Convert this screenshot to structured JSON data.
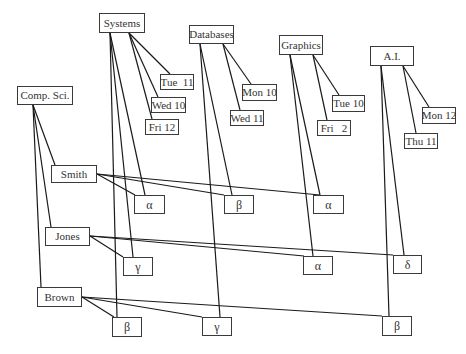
{
  "diagram": {
    "width": 466,
    "height": 354,
    "colors": {
      "line": "#1a1a1a",
      "box_border": "#3a3a3a",
      "text": "#333333",
      "background": "#ffffff"
    },
    "nodes": [
      {
        "id": "systems",
        "label": "Systems",
        "kind": "course",
        "x": 99,
        "y": 13,
        "w": 46,
        "h": 20
      },
      {
        "id": "databases",
        "label": "Databases",
        "kind": "course",
        "x": 189,
        "y": 25,
        "w": 45,
        "h": 19
      },
      {
        "id": "graphics",
        "label": "Graphics",
        "kind": "course",
        "x": 279,
        "y": 35,
        "w": 44,
        "h": 20
      },
      {
        "id": "ai",
        "label": "A.I.",
        "kind": "course",
        "x": 370,
        "y": 46,
        "w": 44,
        "h": 20
      },
      {
        "id": "compsci",
        "label": "Comp. Sci.",
        "kind": "dept",
        "x": 17,
        "y": 86,
        "w": 56,
        "h": 19
      },
      {
        "id": "tue11",
        "label": "Tue  11",
        "kind": "time",
        "x": 160,
        "y": 74,
        "w": 34,
        "h": 16
      },
      {
        "id": "wed10",
        "label": "Wed 10",
        "kind": "time",
        "x": 151,
        "y": 97,
        "w": 35,
        "h": 16
      },
      {
        "id": "fri12",
        "label": "Fri 12",
        "kind": "time",
        "x": 145,
        "y": 119,
        "w": 34,
        "h": 16
      },
      {
        "id": "mon10",
        "label": "Mon 10",
        "kind": "time",
        "x": 242,
        "y": 84,
        "w": 35,
        "h": 17
      },
      {
        "id": "wed11",
        "label": "Wed 11",
        "kind": "time",
        "x": 230,
        "y": 110,
        "w": 34,
        "h": 16
      },
      {
        "id": "tue10",
        "label": "Tue 10",
        "kind": "time",
        "x": 332,
        "y": 95,
        "w": 33,
        "h": 17
      },
      {
        "id": "fri2",
        "label": "Fri   2",
        "kind": "time",
        "x": 317,
        "y": 120,
        "w": 34,
        "h": 16
      },
      {
        "id": "mon12",
        "label": "Mon 12",
        "kind": "time",
        "x": 422,
        "y": 107,
        "w": 34,
        "h": 17
      },
      {
        "id": "thu11",
        "label": "Thu 11",
        "kind": "time",
        "x": 404,
        "y": 133,
        "w": 34,
        "h": 16
      },
      {
        "id": "smith",
        "label": "Smith",
        "kind": "person",
        "x": 51,
        "y": 165,
        "w": 46,
        "h": 18
      },
      {
        "id": "jones",
        "label": "Jones",
        "kind": "person",
        "x": 45,
        "y": 227,
        "w": 45,
        "h": 19
      },
      {
        "id": "brown",
        "label": "Brown",
        "kind": "person",
        "x": 37,
        "y": 287,
        "w": 45,
        "h": 20
      },
      {
        "id": "alpha1",
        "label": "α",
        "kind": "greek",
        "x": 134,
        "y": 195,
        "w": 31,
        "h": 19
      },
      {
        "id": "beta1",
        "label": "β",
        "kind": "greek",
        "x": 224,
        "y": 195,
        "w": 30,
        "h": 19
      },
      {
        "id": "alpha2",
        "label": "α",
        "kind": "greek",
        "x": 313,
        "y": 195,
        "w": 31,
        "h": 19
      },
      {
        "id": "gamma1",
        "label": "γ",
        "kind": "greek",
        "x": 123,
        "y": 257,
        "w": 30,
        "h": 19
      },
      {
        "id": "alpha3",
        "label": "α",
        "kind": "greek",
        "x": 303,
        "y": 256,
        "w": 30,
        "h": 19
      },
      {
        "id": "delta1",
        "label": "δ",
        "kind": "greek",
        "x": 393,
        "y": 255,
        "w": 29,
        "h": 19
      },
      {
        "id": "beta2",
        "label": "β",
        "kind": "greek",
        "x": 112,
        "y": 317,
        "w": 30,
        "h": 20
      },
      {
        "id": "gamma2",
        "label": "γ",
        "kind": "greek",
        "x": 202,
        "y": 317,
        "w": 30,
        "h": 19
      },
      {
        "id": "beta3",
        "label": "β",
        "kind": "greek",
        "x": 382,
        "y": 316,
        "w": 30,
        "h": 20
      }
    ],
    "edges": [
      {
        "x1": 129,
        "y1": 33,
        "x2": 170,
        "y2": 74
      },
      {
        "x1": 129,
        "y1": 33,
        "x2": 158,
        "y2": 97
      },
      {
        "x1": 129,
        "y1": 33,
        "x2": 152,
        "y2": 119
      },
      {
        "x1": 110,
        "y1": 33,
        "x2": 145,
        "y2": 195
      },
      {
        "x1": 110,
        "y1": 33,
        "x2": 133,
        "y2": 257
      },
      {
        "x1": 110,
        "y1": 33,
        "x2": 117,
        "y2": 317
      },
      {
        "x1": 223,
        "y1": 44,
        "x2": 251,
        "y2": 84
      },
      {
        "x1": 223,
        "y1": 44,
        "x2": 240,
        "y2": 110
      },
      {
        "x1": 200,
        "y1": 44,
        "x2": 232,
        "y2": 195
      },
      {
        "x1": 200,
        "y1": 44,
        "x2": 220,
        "y2": 317
      },
      {
        "x1": 313,
        "y1": 55,
        "x2": 339,
        "y2": 95
      },
      {
        "x1": 313,
        "y1": 55,
        "x2": 327,
        "y2": 120
      },
      {
        "x1": 290,
        "y1": 55,
        "x2": 320,
        "y2": 195
      },
      {
        "x1": 290,
        "y1": 55,
        "x2": 313,
        "y2": 256
      },
      {
        "x1": 403,
        "y1": 66,
        "x2": 429,
        "y2": 107
      },
      {
        "x1": 403,
        "y1": 66,
        "x2": 416,
        "y2": 133
      },
      {
        "x1": 381,
        "y1": 66,
        "x2": 404,
        "y2": 255
      },
      {
        "x1": 381,
        "y1": 66,
        "x2": 389,
        "y2": 316
      },
      {
        "x1": 33,
        "y1": 105,
        "x2": 55,
        "y2": 165
      },
      {
        "x1": 33,
        "y1": 105,
        "x2": 51,
        "y2": 227
      },
      {
        "x1": 33,
        "y1": 105,
        "x2": 41,
        "y2": 287
      },
      {
        "x1": 97,
        "y1": 174,
        "x2": 135,
        "y2": 195
      },
      {
        "x1": 97,
        "y1": 174,
        "x2": 224,
        "y2": 195
      },
      {
        "x1": 97,
        "y1": 174,
        "x2": 320,
        "y2": 195
      },
      {
        "x1": 90,
        "y1": 236,
        "x2": 123,
        "y2": 257
      },
      {
        "x1": 90,
        "y1": 236,
        "x2": 304,
        "y2": 256
      },
      {
        "x1": 90,
        "y1": 236,
        "x2": 393,
        "y2": 255
      },
      {
        "x1": 82,
        "y1": 297,
        "x2": 114,
        "y2": 317
      },
      {
        "x1": 82,
        "y1": 297,
        "x2": 202,
        "y2": 317
      },
      {
        "x1": 82,
        "y1": 297,
        "x2": 382,
        "y2": 316
      }
    ]
  }
}
